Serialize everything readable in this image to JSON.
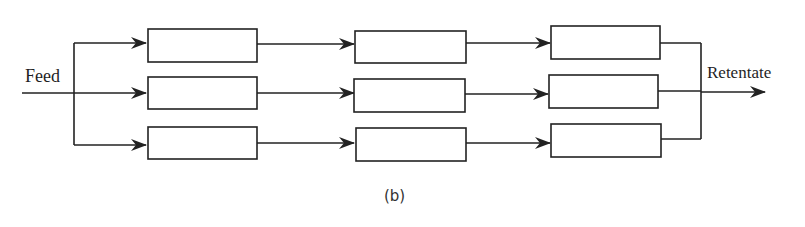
{
  "diagram": {
    "type": "parallel-stage flow diagram",
    "input_label": "Feed",
    "output_label": "Retentate",
    "caption": "(b)",
    "stroke_color": "#222222",
    "rows": 3,
    "columns": 3,
    "modules": [
      {
        "row": 1,
        "col": 1,
        "label": ""
      },
      {
        "row": 1,
        "col": 2,
        "label": ""
      },
      {
        "row": 1,
        "col": 3,
        "label": ""
      },
      {
        "row": 2,
        "col": 1,
        "label": ""
      },
      {
        "row": 2,
        "col": 2,
        "label": ""
      },
      {
        "row": 2,
        "col": 3,
        "label": ""
      },
      {
        "row": 3,
        "col": 1,
        "label": ""
      },
      {
        "row": 3,
        "col": 2,
        "label": ""
      },
      {
        "row": 3,
        "col": 3,
        "label": ""
      }
    ]
  }
}
